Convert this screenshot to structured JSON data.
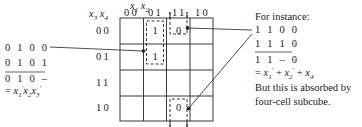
{
  "kmap": {
    "col_var_label": [
      "x",
      "1",
      "x",
      "2"
    ],
    "row_var_label": [
      "x",
      "3",
      "x",
      "4"
    ],
    "col_headers": [
      "00",
      "01",
      "11",
      "10"
    ],
    "row_headers": [
      "00",
      "01",
      "11",
      "10"
    ],
    "cells": [
      {
        "row": "00",
        "col": "01",
        "value": "1"
      },
      {
        "row": "01",
        "col": "01",
        "value": "1"
      },
      {
        "row": "00",
        "col": "11",
        "value": "0"
      },
      {
        "row": "10",
        "col": "11",
        "value": "0"
      }
    ]
  },
  "left_note": {
    "line1": "0 1 0 0",
    "line2": "0 1 0 1",
    "result": "0 1 0 –",
    "expr_prefix": "= ",
    "expr_terms": [
      [
        "x",
        "1",
        "′"
      ],
      [
        "x",
        "2",
        ""
      ],
      [
        "x",
        "3",
        "′"
      ]
    ]
  },
  "right_note": {
    "heading": "For instance:",
    "line1": "1 1 0 0",
    "line2": "1 1 1 0",
    "result": "1 1 – 0",
    "expr_prefix": "= ",
    "expr_terms": [
      [
        "x",
        "1",
        "′"
      ],
      [
        "x",
        "2",
        "′"
      ],
      [
        "x",
        "4",
        ""
      ]
    ],
    "expr_op": " + ",
    "comment1": "But this is absorbed by",
    "comment2": "four-cell subcube."
  }
}
